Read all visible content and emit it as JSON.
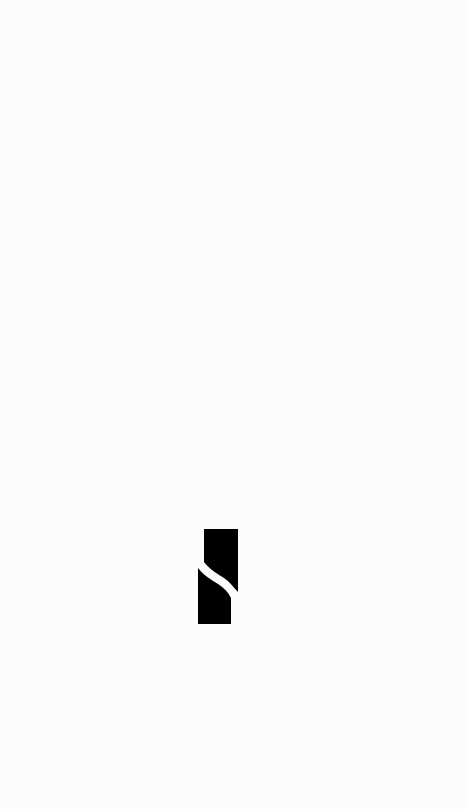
{
  "screen": {
    "type": "splash",
    "background_color": "#fcfcfc"
  },
  "logo": {
    "icon": "app-logo-icon",
    "fill_color": "#000000",
    "cut_color": "#fcfcfc"
  }
}
